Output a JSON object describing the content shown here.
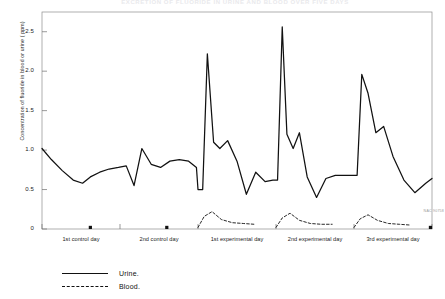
{
  "figure": {
    "title": "EXCRETION OF FLUORIDE IN URINE AND BLOOD OVER FIVE DAYS",
    "corner_code": "NAC 90758"
  },
  "axes": {
    "y_label": "Concentration of fluoride in blood or urine ( ppm)",
    "y_ticks": [
      "2.5",
      "2.0",
      "1.5",
      "1.0",
      "0.5",
      "0"
    ],
    "x_ticks": [
      "1st control day",
      "2nd control day",
      "1st experimental day",
      "2nd experimental day",
      "3rd experimental day"
    ]
  },
  "legend": {
    "items": [
      {
        "key": "solid",
        "label": "Urine."
      },
      {
        "key": "dashed",
        "label": "Blood."
      }
    ]
  },
  "chart_data": {
    "type": "line",
    "title": "EXCRETION OF FLUORIDE IN URINE AND BLOOD OVER FIVE DAYS",
    "xlabel": "",
    "ylabel": "Concentration of fluoride in blood or urine ( ppm)",
    "ylim": [
      0,
      2.75
    ],
    "xlim": [
      0,
      5
    ],
    "grid": false,
    "legend_position": "below-left",
    "yticks": [
      0,
      0.5,
      1.0,
      1.5,
      2.0,
      2.5
    ],
    "ytick_labels": [
      "0",
      "0.5",
      "1.0",
      "1.5",
      "2.0",
      "2.5"
    ],
    "x_day_boundaries": [
      0,
      1,
      2,
      3,
      4,
      5
    ],
    "x_day_labels": [
      "1st control day",
      "2nd control day",
      "1st experimental day",
      "2nd experimental day",
      "3rd experimental day"
    ],
    "series": [
      {
        "name": "Urine.",
        "style": "solid",
        "x": [
          0.0,
          0.12,
          0.26,
          0.4,
          0.52,
          0.62,
          0.74,
          0.86,
          0.98,
          1.08,
          1.18,
          1.28,
          1.4,
          1.52,
          1.64,
          1.76,
          1.88,
          1.98,
          2.0,
          2.06,
          2.12,
          2.2,
          2.28,
          2.38,
          2.5,
          2.62,
          2.74,
          2.86,
          2.96,
          3.02,
          3.08,
          3.14,
          3.22,
          3.3,
          3.4,
          3.52,
          3.64,
          3.76,
          3.88,
          3.98,
          4.04,
          4.1,
          4.18,
          4.28,
          4.38,
          4.5,
          4.64,
          4.78,
          4.92,
          5.0
        ],
        "y": [
          1.02,
          0.88,
          0.74,
          0.62,
          0.58,
          0.66,
          0.72,
          0.76,
          0.78,
          0.8,
          0.55,
          1.02,
          0.82,
          0.78,
          0.86,
          0.88,
          0.86,
          0.78,
          0.5,
          0.5,
          2.22,
          1.1,
          1.02,
          1.12,
          0.86,
          0.44,
          0.72,
          0.6,
          0.62,
          0.62,
          2.56,
          1.2,
          1.02,
          1.22,
          0.66,
          0.4,
          0.64,
          0.68,
          0.68,
          0.68,
          0.68,
          1.96,
          1.72,
          1.22,
          1.3,
          0.92,
          0.62,
          0.46,
          0.58,
          0.64
        ]
      },
      {
        "name": "Blood.",
        "style": "dashed",
        "segments": [
          {
            "x": [
              2.0,
              2.08,
              2.18,
              2.3,
              2.44,
              2.58,
              2.72
            ],
            "y": [
              0.02,
              0.16,
              0.22,
              0.12,
              0.08,
              0.07,
              0.06
            ]
          },
          {
            "x": [
              3.0,
              3.08,
              3.18,
              3.3,
              3.44,
              3.58,
              3.72
            ],
            "y": [
              0.02,
              0.14,
              0.2,
              0.11,
              0.07,
              0.06,
              0.06
            ]
          },
          {
            "x": [
              4.0,
              4.08,
              4.18,
              4.3,
              4.44,
              4.58,
              4.72
            ],
            "y": [
              0.02,
              0.13,
              0.18,
              0.11,
              0.07,
              0.06,
              0.05
            ]
          }
        ],
        "point_markers": [
          {
            "x": 0.62,
            "y": 0.02
          },
          {
            "x": 1.6,
            "y": 0.02
          },
          {
            "x": 4.98,
            "y": 0.02
          }
        ]
      }
    ]
  }
}
